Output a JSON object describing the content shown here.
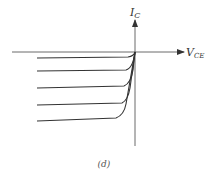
{
  "diagram": {
    "y_axis": {
      "label_main": "I",
      "label_sub": "C"
    },
    "x_axis": {
      "label_main": "V",
      "label_sub": "CE"
    },
    "caption": "(d)",
    "curve_count": 5,
    "line_color": "#333333"
  }
}
